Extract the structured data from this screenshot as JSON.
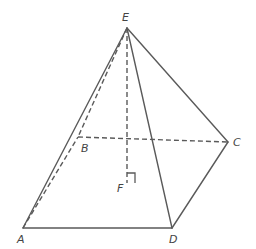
{
  "figure": {
    "type": "pyramid",
    "colors": {
      "stroke": "#5a5a5a",
      "label": "#444444",
      "background": "#ffffff"
    },
    "vertices": {
      "E": {
        "label": "E",
        "x": 127,
        "y": 28
      },
      "A": {
        "label": "A",
        "x": 23,
        "y": 228
      },
      "B": {
        "label": "B",
        "x": 78,
        "y": 137
      },
      "C": {
        "label": "C",
        "x": 228,
        "y": 142
      },
      "D": {
        "label": "D",
        "x": 172,
        "y": 228
      },
      "F": {
        "label": "F",
        "x": 127,
        "y": 183
      }
    },
    "edges_visible": [
      "EA",
      "ED",
      "EC",
      "AD",
      "DC"
    ],
    "edges_hidden": [
      "AB",
      "BC",
      "EB",
      "EF"
    ],
    "markers": [
      {
        "type": "right-angle",
        "at": "F"
      }
    ]
  }
}
